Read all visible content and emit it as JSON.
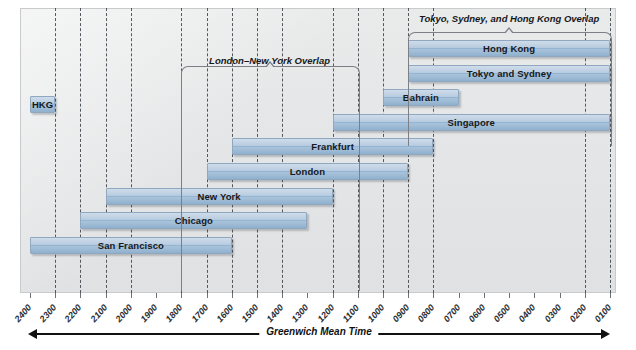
{
  "chart_data": {
    "type": "bar",
    "title": "",
    "xlabel": "Greenwich Mean Time",
    "ylabel": "",
    "orientation": "horizontal",
    "axis_direction": "right-to-left",
    "xlim": [
      "2400",
      "0100"
    ],
    "grid": true,
    "legend": "none",
    "tick_labels": [
      "2400",
      "2300",
      "2200",
      "2100",
      "2000",
      "1900",
      "1800",
      "1700",
      "1600",
      "1500",
      "1400",
      "1300",
      "1200",
      "1100",
      "1000",
      "0900",
      "0800",
      "0700",
      "0600",
      "0500",
      "0400",
      "0300",
      "0200",
      "0100"
    ],
    "categories": [
      "HKG",
      "Hong Kong",
      "Tokyo and Sydney",
      "Bahrain",
      "Singapore",
      "Frankfurt",
      "London",
      "New York",
      "Chicago",
      "San Francisco"
    ],
    "bars": [
      {
        "label": "HKG",
        "start": "2400",
        "end": "2300",
        "row": 0
      },
      {
        "label": "Hong Kong",
        "start": "0900",
        "end": "0100",
        "row": 1
      },
      {
        "label": "Tokyo and Sydney",
        "start": "0900",
        "end": "0100",
        "row": 2
      },
      {
        "label": "Bahrain",
        "start": "1000",
        "end": "0700",
        "row": 3
      },
      {
        "label": "Singapore",
        "start": "1200",
        "end": "0100",
        "row": 4
      },
      {
        "label": "Frankfurt",
        "start": "1600",
        "end": "0800",
        "row": 5
      },
      {
        "label": "London",
        "start": "1700",
        "end": "0900",
        "row": 6
      },
      {
        "label": "New York",
        "start": "2100",
        "end": "1200",
        "row": 7
      },
      {
        "label": "Chicago",
        "start": "2200",
        "end": "1300",
        "row": 8
      },
      {
        "label": "San Francisco",
        "start": "2400",
        "end": "1600",
        "row": 9
      }
    ],
    "annotations": [
      {
        "name": "london-new-york-overlap",
        "text": "London–New York Overlap",
        "start": "1800",
        "end": "1100"
      },
      {
        "name": "tokyo-sydney-hong-kong-overlap",
        "text": "Tokyo, Sydney, and Hong Kong Overlap",
        "start": "0900",
        "end": "0100"
      }
    ],
    "gridline_times": [
      "2300",
      "2200",
      "2100",
      "2000",
      "1800",
      "1700",
      "1600",
      "1500",
      "1400",
      "1200",
      "1100",
      "1000",
      "0900",
      "0800",
      "0200",
      "0100"
    ],
    "colors": {
      "bar_fill": "#a8c2da",
      "bar_border": "#8fa8bf",
      "panel_bg": "#e6e7e8",
      "gridline": "#3b3f46",
      "text": "#16181b",
      "bracket": "#7c8086"
    }
  }
}
